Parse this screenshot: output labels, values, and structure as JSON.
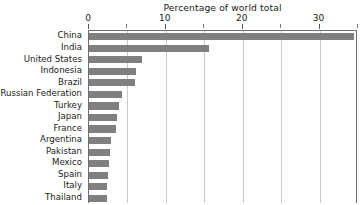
{
  "chart_data": {
    "type": "bar",
    "orientation": "horizontal",
    "title": "Percentage of world total",
    "xlabel": "",
    "ylabel": "",
    "xlim": [
      0,
      35
    ],
    "grid": true,
    "legend": "none",
    "bar_color": "#808080",
    "axis_color": "#6e6e6e",
    "gridline_color": "#c9c9c9",
    "tick_labels": [
      "0",
      "10",
      "20",
      "30"
    ],
    "tick_values": [
      0,
      10,
      20,
      30
    ],
    "minor_tick_values": [
      5,
      15,
      25,
      35
    ],
    "categories": [
      "China",
      "India",
      "United States",
      "Indonesia",
      "Brazil",
      "Russian Federation",
      "Turkey",
      "Japan",
      "France",
      "Argentina",
      "Pakistan",
      "Mexico",
      "Spain",
      "Italy",
      "Thailand"
    ],
    "values": [
      34.5,
      15.6,
      6.9,
      6.1,
      6.0,
      4.3,
      3.9,
      3.6,
      3.5,
      2.9,
      2.7,
      2.6,
      2.5,
      2.4,
      2.3
    ]
  }
}
